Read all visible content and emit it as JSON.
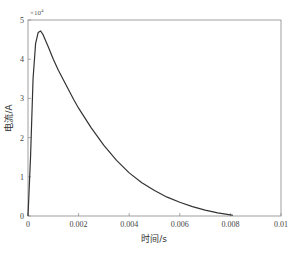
{
  "chart_data": {
    "type": "line",
    "title": "",
    "xlabel": "时间/s",
    "ylabel": "电流/A",
    "y_multiplier": "×10",
    "y_multiplier_exp": "4",
    "xlim": [
      0,
      0.01
    ],
    "ylim": [
      0,
      5
    ],
    "x_ticks": [
      0,
      0.002,
      0.004,
      0.006,
      0.008,
      0.01
    ],
    "x_tick_labels": [
      "0",
      "0.002",
      "0.004",
      "0.006",
      "0.008",
      "0.01"
    ],
    "y_ticks": [
      0,
      1,
      2,
      3,
      4,
      5
    ],
    "y_tick_labels": [
      "0",
      "1",
      "2",
      "3",
      "4",
      "5"
    ],
    "grid": false,
    "legend": null,
    "series": [
      {
        "name": "电流",
        "color": "#333333",
        "x": [
          0,
          0.0001,
          0.0002,
          0.0003,
          0.0004,
          0.0005,
          0.0006,
          0.0008,
          0.001,
          0.0012,
          0.0015,
          0.0018,
          0.002,
          0.0025,
          0.003,
          0.0035,
          0.004,
          0.0045,
          0.005,
          0.0055,
          0.006,
          0.0065,
          0.007,
          0.0075,
          0.008,
          0.0081
        ],
        "values": [
          0,
          1.5,
          3.5,
          4.4,
          4.68,
          4.72,
          4.62,
          4.32,
          4.0,
          3.72,
          3.35,
          2.98,
          2.75,
          2.25,
          1.8,
          1.42,
          1.1,
          0.85,
          0.65,
          0.48,
          0.35,
          0.24,
          0.15,
          0.08,
          0.03,
          0.02
        ]
      }
    ]
  }
}
